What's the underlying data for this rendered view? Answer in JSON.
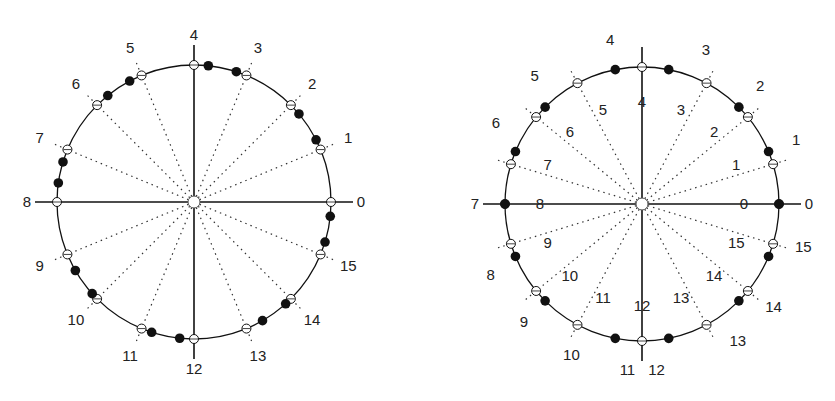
{
  "diagrams": [
    {
      "cx": 194,
      "cy": 202,
      "r": 137,
      "open_angles": [
        0,
        22.5,
        45,
        67.5,
        90,
        112.5,
        135,
        157.5,
        180,
        202.5,
        225,
        247.5,
        270,
        292.5,
        315,
        337.5
      ],
      "filled_angles": [
        84,
        72,
        40,
        27,
        -6,
        -17,
        -48,
        -60,
        -96,
        -108,
        -138,
        -150,
        172,
        163,
        129,
        118
      ],
      "outer_labels": [
        "0",
        "1",
        "2",
        "3",
        "4",
        "5",
        "6",
        "7",
        "8",
        "9",
        "10",
        "11",
        "12",
        "13",
        "14",
        "15"
      ],
      "inner_labels": []
    },
    {
      "cx": 642,
      "cy": 204,
      "r": 137,
      "open_angles": [
        0,
        16.9,
        39.4,
        61.9,
        90,
        118.1,
        140.6,
        163.1,
        180,
        196.9,
        219.4,
        241.9,
        270,
        298.1,
        320.6,
        343.1
      ],
      "filled_angles": [
        0,
        22.5,
        45,
        78.75,
        101.25,
        135,
        157.5,
        180,
        202.5,
        225,
        258.75,
        281.25,
        315,
        337.5
      ],
      "outer_labels": [
        "0",
        "1",
        "2",
        "3",
        "4",
        "5",
        "6",
        "7",
        "8",
        "9",
        "10",
        "11",
        "12",
        "13",
        "14",
        "15"
      ],
      "inner_labels": [
        "0",
        "1",
        "2",
        "3",
        "4",
        "5",
        "6",
        "7",
        "8",
        "9",
        "10",
        "11",
        "12",
        "13",
        "14",
        "15"
      ]
    }
  ]
}
